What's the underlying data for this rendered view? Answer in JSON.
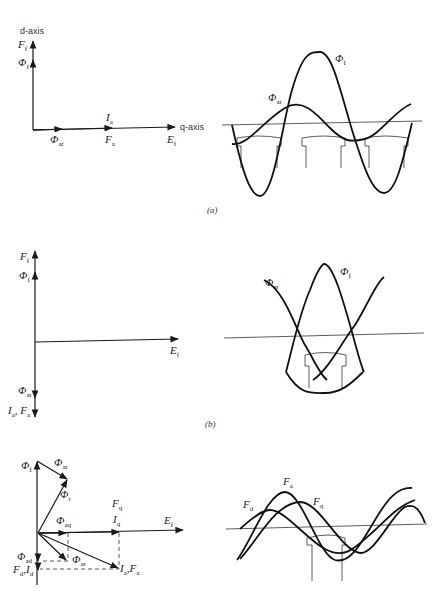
{
  "figure": {
    "panels": [
      {
        "id": "a",
        "caption": "(a)",
        "phasor_diagram": {
          "vertical_axis_label": "d-axis",
          "horizontal_axis_label": "q-axis",
          "labels": {
            "Ff": "F",
            "Ff_sub": "f",
            "Phif": "Φ",
            "Phif_sub": "f",
            "Ia": "I",
            "Ia_sub": "a",
            "Phiar": "Φ",
            "Phiar_sub": "ar",
            "Fa": "F",
            "Fa_sub": "a",
            "Ef": "E",
            "Ef_sub": "f"
          }
        },
        "waveform": {
          "labels": {
            "Phif": "Φ",
            "Phif_sub": "f",
            "Phiar": "Φ",
            "Phiar_sub": "ar"
          }
        }
      },
      {
        "id": "b",
        "caption": "(b)",
        "phasor_diagram": {
          "labels": {
            "Ff": "F",
            "Ff_sub": "f",
            "Phif": "Φ",
            "Phif_sub": "f",
            "Ef": "E",
            "Ef_sub": "f",
            "Phiar": "Φ",
            "Phiar_sub": "ar",
            "IaFa": "I",
            "IaFa_sub1": "a",
            "IaFa_mid": ", F",
            "IaFa_sub2": "a"
          }
        },
        "waveform": {
          "labels": {
            "Phif": "Φ",
            "Phif_sub": "f",
            "Phiar": "Φ",
            "Phiar_sub": "ar"
          }
        }
      },
      {
        "id": "c",
        "caption": "",
        "phasor_diagram": {
          "labels": {
            "Phif": "Φ",
            "Phif_sub": "f",
            "Phiar_top": "Φ",
            "Phiar_top_sub": "ar",
            "Phir": "Φ",
            "Phir_sub": "r",
            "Fq": "F",
            "Fq_sub": "q",
            "Iq": "I",
            "Iq_sub": "q",
            "Phiaq": "Φ",
            "Phiaq_sub": "aq",
            "Ef": "E",
            "Ef_sub": "f",
            "Phiad": "Φ",
            "Phiad_sub": "ad",
            "Phiar_low": "Φ",
            "Phiar_low_sub": "ar",
            "FdId": "F",
            "FdId_sub1": "d",
            "FdId_mid": ",I",
            "FdId_sub2": "d",
            "IaFa": "I",
            "IaFa_sub1": "a",
            "IaFa_mid": ",F",
            "IaFa_sub2": "a"
          }
        },
        "waveform": {
          "labels": {
            "Fa": "F",
            "Fa_sub": "a",
            "Fd": "F",
            "Fd_sub": "d",
            "Fq": "F",
            "Fq_sub": "q"
          }
        }
      }
    ]
  }
}
